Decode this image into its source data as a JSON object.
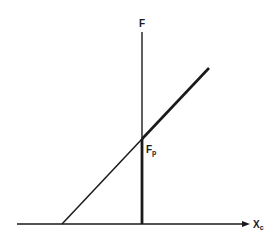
{
  "diagram": {
    "colors": {
      "ink": "#1a1a1a",
      "background": "#ffffff"
    },
    "labels": {
      "vertical_axis": "F",
      "intersection": "F",
      "intersection_sub": "p",
      "horizontal_axis": "X",
      "horizontal_axis_sub": "c"
    },
    "elements": [
      "horizontal axis with arrow pointing right (X_c)",
      "vertical line labeled F, thin above intersection, thick below",
      "diagonal line rising from horizontal axis through intersection point F_p"
    ]
  }
}
